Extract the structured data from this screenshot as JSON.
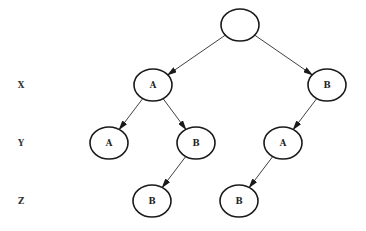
{
  "diagram": {
    "type": "tree",
    "row_labels": [
      {
        "label": "X",
        "x": 21,
        "y": 85
      },
      {
        "label": "Y",
        "x": 21,
        "y": 143
      },
      {
        "label": "Z",
        "x": 21,
        "y": 201
      }
    ],
    "nodes": [
      {
        "id": "root",
        "label": "",
        "x": 240,
        "y": 25
      },
      {
        "id": "xA",
        "label": "A",
        "x": 153,
        "y": 85
      },
      {
        "id": "xB",
        "label": "B",
        "x": 327,
        "y": 85
      },
      {
        "id": "yA1",
        "label": "A",
        "x": 109,
        "y": 143
      },
      {
        "id": "yB",
        "label": "B",
        "x": 196,
        "y": 143
      },
      {
        "id": "yA2",
        "label": "A",
        "x": 283,
        "y": 143
      },
      {
        "id": "zB1",
        "label": "B",
        "x": 152,
        "y": 201
      },
      {
        "id": "zB2",
        "label": "B",
        "x": 239,
        "y": 201
      }
    ],
    "edges": [
      {
        "from": "root",
        "to": "xA"
      },
      {
        "from": "root",
        "to": "xB"
      },
      {
        "from": "xA",
        "to": "yA1"
      },
      {
        "from": "xA",
        "to": "yB"
      },
      {
        "from": "xB",
        "to": "yA2"
      },
      {
        "from": "yB",
        "to": "zB1"
      },
      {
        "from": "yA2",
        "to": "zB2"
      }
    ],
    "node_rx": 19,
    "node_ry": 16,
    "colors": {
      "stroke": "#1a1a1a",
      "background": "#ffffff"
    }
  }
}
